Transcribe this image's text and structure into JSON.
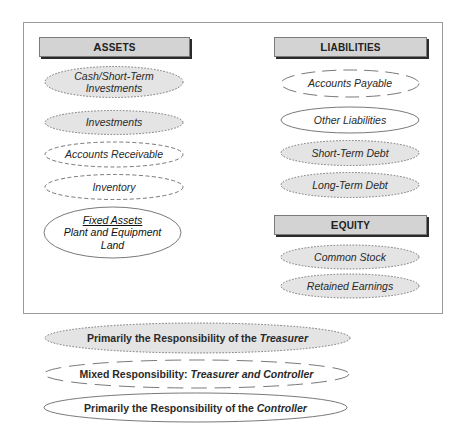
{
  "diagram": {
    "sections": {
      "assets": {
        "title_first": "A",
        "title_rest": "SSETS",
        "items": [
          {
            "lines": [
              "Cash/Short-Term",
              "Investments"
            ],
            "responsibility": "treasurer"
          },
          {
            "lines": [
              "Investments"
            ],
            "responsibility": "treasurer"
          },
          {
            "lines": [
              "Accounts Receivable"
            ],
            "responsibility": "mixed"
          },
          {
            "lines": [
              "Inventory"
            ],
            "responsibility": "mixed"
          },
          {
            "heading": "Fixed Assets",
            "lines": [
              "Plant and Equipment",
              "Land"
            ],
            "responsibility": "controller"
          }
        ]
      },
      "liabilities": {
        "title_first": "L",
        "title_rest": "IABILITIES",
        "items": [
          {
            "lines": [
              "Accounts Payable"
            ],
            "responsibility": "mixed"
          },
          {
            "lines": [
              "Other Liabilities"
            ],
            "responsibility": "controller"
          },
          {
            "lines": [
              "Short-Term Debt"
            ],
            "responsibility": "treasurer"
          },
          {
            "lines": [
              "Long-Term Debt"
            ],
            "responsibility": "treasurer"
          }
        ]
      },
      "equity": {
        "title_first": "E",
        "title_rest": "QUITY",
        "items": [
          {
            "lines": [
              "Common Stock"
            ],
            "responsibility": "treasurer"
          },
          {
            "lines": [
              "Retained Earnings"
            ],
            "responsibility": "treasurer"
          }
        ]
      }
    },
    "legend": [
      {
        "key": "treasurer",
        "prefix": "Primarily the Responsibility of the ",
        "emphasis": "Treasurer",
        "style": "dotted, gray fill"
      },
      {
        "key": "mixed",
        "prefix": "Mixed Responsibility: ",
        "emphasis": "Treasurer and Controller",
        "style": "dashed, white fill"
      },
      {
        "key": "controller",
        "prefix": "Primarily the Responsibility of the ",
        "emphasis": "Controller",
        "style": "solid, white fill"
      }
    ],
    "colors": {
      "header_fill": "#d3d3d3",
      "header_shadow": "#2a2a2a",
      "treasurer_fill": "#e4e4e4",
      "outline": "#6a6a6a",
      "frame": "#9a9a9a"
    }
  }
}
